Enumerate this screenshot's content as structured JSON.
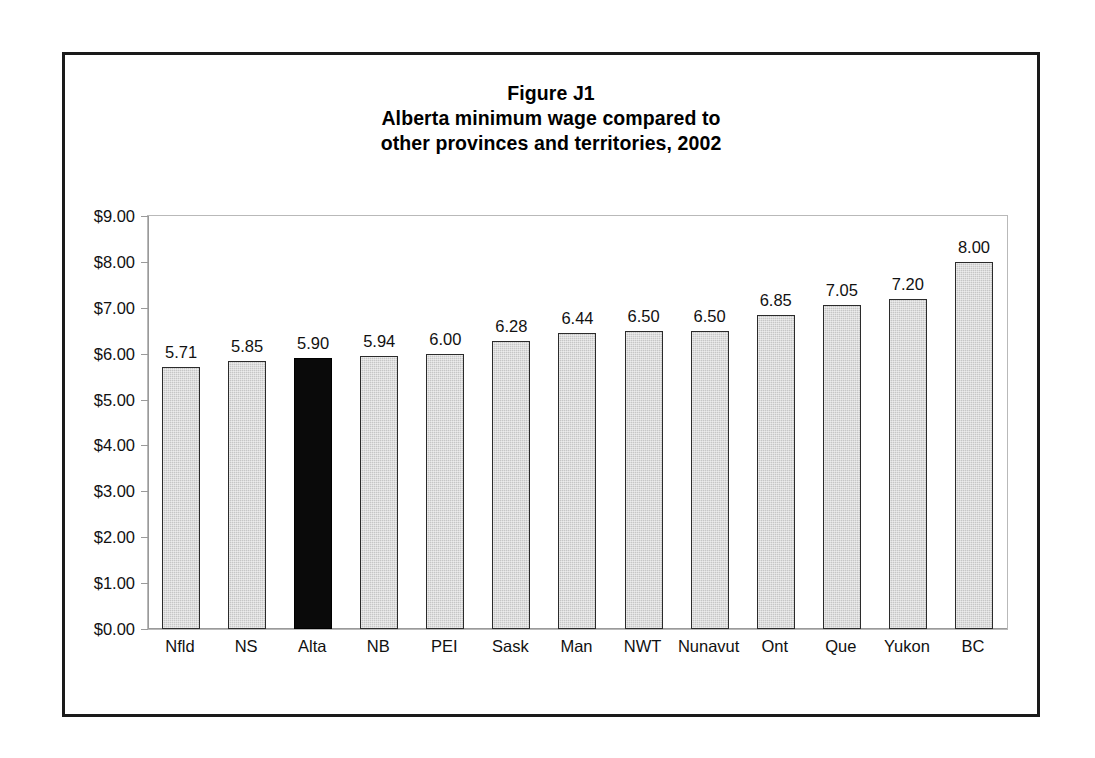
{
  "figure": {
    "title_lines": [
      "Figure J1",
      "Alberta minimum wage compared to",
      "other provinces and territories, 2002"
    ],
    "frame_color": "#1a1a1a",
    "background_color": "#ffffff"
  },
  "chart_data": {
    "type": "bar",
    "xlabel": "",
    "ylabel": "",
    "ylim": [
      0,
      9
    ],
    "grid": false,
    "legend": "none",
    "y_tick_labels": [
      "$0.00",
      "$1.00",
      "$2.00",
      "$3.00",
      "$4.00",
      "$5.00",
      "$6.00",
      "$7.00",
      "$8.00",
      "$9.00"
    ],
    "y_tick_values": [
      0,
      1,
      2,
      3,
      4,
      5,
      6,
      7,
      8,
      9
    ],
    "categories": [
      "Nfld",
      "NS",
      "Alta",
      "NB",
      "PEI",
      "Sask",
      "Man",
      "NWT",
      "Nunavut",
      "Ont",
      "Que",
      "Yukon",
      "BC"
    ],
    "values": [
      5.71,
      5.85,
      5.9,
      5.94,
      6.0,
      6.28,
      6.44,
      6.5,
      6.5,
      6.85,
      7.05,
      7.2,
      8.0
    ],
    "data_labels": [
      "5.71",
      "5.85",
      "5.90",
      "5.94",
      "6.00",
      "6.28",
      "6.44",
      "6.50",
      "6.50",
      "6.85",
      "7.05",
      "7.20",
      "8.00"
    ],
    "highlight_category": "Alta",
    "highlight_index": 2,
    "bar_fill_color": "#c6c6c6",
    "bar_border_color": "#2b2b2b",
    "highlight_fill_color": "#0a0a0a"
  }
}
